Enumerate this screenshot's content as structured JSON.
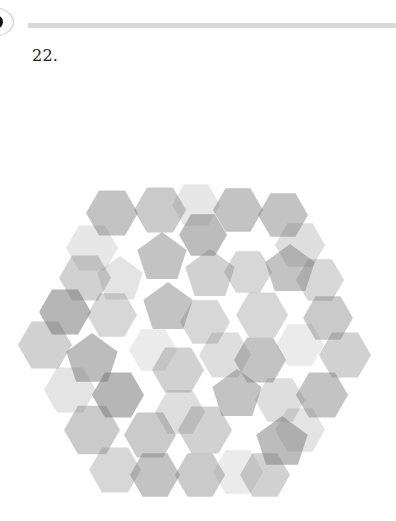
{
  "header": {
    "badge_icon": "dot-in-oval-icon",
    "rule_color": "#d9d9d9"
  },
  "question": {
    "number_label": "22."
  },
  "figure": {
    "fill_color": "#7a7a7a",
    "shapes": [
      {
        "type": "hex",
        "cx": 112,
        "cy": 63,
        "r": 26,
        "o": 0.45
      },
      {
        "type": "hex",
        "cx": 160,
        "cy": 60,
        "r": 26,
        "o": 0.4
      },
      {
        "type": "hex",
        "cx": 196,
        "cy": 55,
        "r": 24,
        "o": 0.18
      },
      {
        "type": "hex",
        "cx": 238,
        "cy": 60,
        "r": 25,
        "o": 0.45
      },
      {
        "type": "hex",
        "cx": 283,
        "cy": 65,
        "r": 25,
        "o": 0.45
      },
      {
        "type": "hex",
        "cx": 92,
        "cy": 98,
        "r": 26,
        "o": 0.18
      },
      {
        "type": "pent",
        "cx": 162,
        "cy": 108,
        "r": 26,
        "o": 0.45
      },
      {
        "type": "hex",
        "cx": 203,
        "cy": 85,
        "r": 24,
        "o": 0.5
      },
      {
        "type": "hex",
        "cx": 300,
        "cy": 95,
        "r": 25,
        "o": 0.25
      },
      {
        "type": "hex",
        "cx": 85,
        "cy": 128,
        "r": 26,
        "o": 0.35
      },
      {
        "type": "pent",
        "cx": 120,
        "cy": 130,
        "r": 24,
        "o": 0.2
      },
      {
        "type": "pent",
        "cx": 210,
        "cy": 125,
        "r": 26,
        "o": 0.35
      },
      {
        "type": "hex",
        "cx": 248,
        "cy": 122,
        "r": 24,
        "o": 0.3
      },
      {
        "type": "pent",
        "cx": 290,
        "cy": 120,
        "r": 26,
        "o": 0.45
      },
      {
        "type": "hex",
        "cx": 320,
        "cy": 130,
        "r": 24,
        "o": 0.3
      },
      {
        "type": "hex",
        "cx": 65,
        "cy": 162,
        "r": 26,
        "o": 0.55
      },
      {
        "type": "hex",
        "cx": 112,
        "cy": 165,
        "r": 25,
        "o": 0.3
      },
      {
        "type": "pent",
        "cx": 168,
        "cy": 158,
        "r": 26,
        "o": 0.45
      },
      {
        "type": "hex",
        "cx": 205,
        "cy": 172,
        "r": 25,
        "o": 0.3
      },
      {
        "type": "hex",
        "cx": 262,
        "cy": 165,
        "r": 26,
        "o": 0.3
      },
      {
        "type": "hex",
        "cx": 328,
        "cy": 168,
        "r": 25,
        "o": 0.4
      },
      {
        "type": "hex",
        "cx": 45,
        "cy": 195,
        "r": 27,
        "o": 0.35
      },
      {
        "type": "pent",
        "cx": 92,
        "cy": 210,
        "r": 27,
        "o": 0.5
      },
      {
        "type": "hex",
        "cx": 153,
        "cy": 200,
        "r": 24,
        "o": 0.15
      },
      {
        "type": "hex",
        "cx": 225,
        "cy": 205,
        "r": 26,
        "o": 0.25
      },
      {
        "type": "hex",
        "cx": 260,
        "cy": 210,
        "r": 26,
        "o": 0.45
      },
      {
        "type": "hex",
        "cx": 300,
        "cy": 195,
        "r": 24,
        "o": 0.15
      },
      {
        "type": "hex",
        "cx": 345,
        "cy": 205,
        "r": 26,
        "o": 0.35
      },
      {
        "type": "hex",
        "cx": 70,
        "cy": 240,
        "r": 26,
        "o": 0.2
      },
      {
        "type": "hex",
        "cx": 118,
        "cy": 245,
        "r": 26,
        "o": 0.55
      },
      {
        "type": "hex",
        "cx": 178,
        "cy": 220,
        "r": 26,
        "o": 0.35
      },
      {
        "type": "hex",
        "cx": 180,
        "cy": 262,
        "r": 25,
        "o": 0.25
      },
      {
        "type": "pent",
        "cx": 237,
        "cy": 245,
        "r": 26,
        "o": 0.45
      },
      {
        "type": "hex",
        "cx": 280,
        "cy": 250,
        "r": 25,
        "o": 0.25
      },
      {
        "type": "hex",
        "cx": 322,
        "cy": 245,
        "r": 26,
        "o": 0.45
      },
      {
        "type": "hex",
        "cx": 92,
        "cy": 280,
        "r": 28,
        "o": 0.4
      },
      {
        "type": "hex",
        "cx": 150,
        "cy": 285,
        "r": 26,
        "o": 0.4
      },
      {
        "type": "hex",
        "cx": 205,
        "cy": 280,
        "r": 27,
        "o": 0.35
      },
      {
        "type": "pent",
        "cx": 282,
        "cy": 293,
        "r": 27,
        "o": 0.5
      },
      {
        "type": "hex",
        "cx": 300,
        "cy": 280,
        "r": 25,
        "o": 0.2
      },
      {
        "type": "hex",
        "cx": 115,
        "cy": 320,
        "r": 26,
        "o": 0.3
      },
      {
        "type": "hex",
        "cx": 155,
        "cy": 325,
        "r": 25,
        "o": 0.45
      },
      {
        "type": "hex",
        "cx": 200,
        "cy": 325,
        "r": 25,
        "o": 0.4
      },
      {
        "type": "hex",
        "cx": 238,
        "cy": 322,
        "r": 25,
        "o": 0.15
      },
      {
        "type": "hex",
        "cx": 265,
        "cy": 325,
        "r": 25,
        "o": 0.35
      }
    ]
  }
}
